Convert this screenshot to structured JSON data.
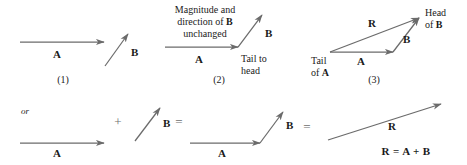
{
  "figure": {
    "stroke_color": "#6b6b6b",
    "text_color": "#1a1a1a",
    "operator_color": "#6e6e6e",
    "background": "#ffffff"
  },
  "panels": [
    {
      "number": "(1)",
      "vectors": [
        {
          "name": "A",
          "label": "A"
        },
        {
          "name": "B",
          "label": "B"
        }
      ]
    },
    {
      "number": "(2)",
      "caption_line1": "Magnitude and",
      "caption_line2_pre": "direction of ",
      "caption_line2_bold": "B",
      "caption_line3": "unchanged",
      "note_line1": "Tail to",
      "note_line2": "head",
      "vectors": [
        {
          "name": "A",
          "label": "A"
        },
        {
          "name": "B",
          "label": "B"
        }
      ]
    },
    {
      "number": "(3)",
      "tail_line1": "Tail",
      "tail_line2_pre": "of ",
      "tail_line2_bold": "A",
      "head_line1": "Head",
      "head_line2_pre": "of ",
      "head_line2_bold": "B",
      "vectors": [
        {
          "name": "A",
          "label": "A"
        },
        {
          "name": "B",
          "label": "B"
        },
        {
          "name": "R",
          "label": "R"
        }
      ]
    }
  ],
  "bottom_row": {
    "or_text": "or",
    "plus_operator": "+",
    "equals_operator_1": "=",
    "equals_operator_2": "=",
    "label_a": "A",
    "label_b_1": "B",
    "label_a_2": "A",
    "label_b_2": "B",
    "label_r": "R",
    "equation": "R = A + B"
  }
}
